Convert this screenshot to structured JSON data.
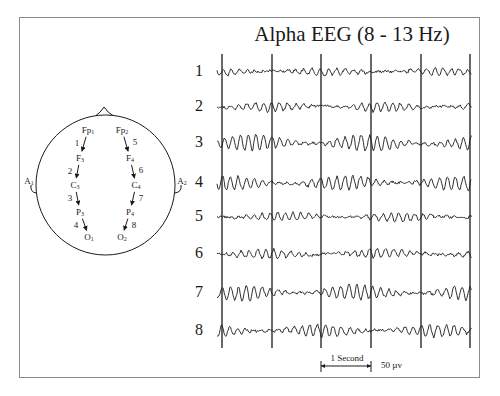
{
  "title": "Alpha EEG (8 - 13 Hz)",
  "head": {
    "electrodes": [
      {
        "id": "Fp1",
        "base": "Fp",
        "sub": "1",
        "x": 88,
        "y": 130
      },
      {
        "id": "F3",
        "base": "F",
        "sub": "3",
        "x": 80,
        "y": 158
      },
      {
        "id": "C3",
        "base": "C",
        "sub": "3",
        "x": 75,
        "y": 185
      },
      {
        "id": "P3",
        "base": "P",
        "sub": "3",
        "x": 80,
        "y": 212
      },
      {
        "id": "O1",
        "base": "O",
        "sub": "1",
        "x": 89,
        "y": 237
      },
      {
        "id": "Fp2",
        "base": "Fp",
        "sub": "2",
        "x": 122,
        "y": 130
      },
      {
        "id": "F4",
        "base": "F",
        "sub": "4",
        "x": 130,
        "y": 158
      },
      {
        "id": "C4",
        "base": "C",
        "sub": "4",
        "x": 136,
        "y": 185
      },
      {
        "id": "P4",
        "base": "P",
        "sub": "4",
        "x": 130,
        "y": 212
      },
      {
        "id": "O2",
        "base": "O",
        "sub": "2",
        "x": 122,
        "y": 237
      }
    ],
    "ears": [
      {
        "id": "A1",
        "base": "A",
        "sub": "1",
        "x": 29,
        "y": 181
      },
      {
        "id": "A2",
        "base": "A",
        "sub": "2",
        "x": 182,
        "y": 181
      }
    ],
    "derivations": [
      {
        "num": "1",
        "from": "Fp1",
        "to": "F3",
        "x": 77,
        "y": 143
      },
      {
        "num": "2",
        "from": "F3",
        "to": "C3",
        "x": 70,
        "y": 171
      },
      {
        "num": "3",
        "from": "C3",
        "to": "P3",
        "x": 70,
        "y": 198
      },
      {
        "num": "4",
        "from": "P3",
        "to": "O1",
        "x": 76,
        "y": 225
      },
      {
        "num": "5",
        "from": "Fp2",
        "to": "F4",
        "x": 135,
        "y": 142
      },
      {
        "num": "6",
        "from": "F4",
        "to": "C4",
        "x": 141,
        "y": 170
      },
      {
        "num": "7",
        "from": "C4",
        "to": "P4",
        "x": 141,
        "y": 198
      },
      {
        "num": "8",
        "from": "P4",
        "to": "O2",
        "x": 134,
        "y": 225
      }
    ]
  },
  "channels": [
    {
      "label": "1",
      "y": 72,
      "amp": 3.5,
      "seed": 11
    },
    {
      "label": "2",
      "y": 107,
      "amp": 4.5,
      "seed": 23
    },
    {
      "label": "3",
      "y": 143,
      "amp": 8,
      "seed": 37
    },
    {
      "label": "4",
      "y": 183,
      "amp": 7,
      "seed": 41
    },
    {
      "label": "5",
      "y": 217,
      "amp": 4,
      "seed": 53
    },
    {
      "label": "6",
      "y": 254,
      "amp": 4.5,
      "seed": 67
    },
    {
      "label": "7",
      "y": 293,
      "amp": 7,
      "seed": 71
    },
    {
      "label": "8",
      "y": 331,
      "amp": 6,
      "seed": 89
    }
  ],
  "time_markers_x": [
    222,
    272,
    321,
    371,
    421,
    470
  ],
  "scale": {
    "time_label": "1 Second",
    "amplitude_label": "50 µv"
  }
}
